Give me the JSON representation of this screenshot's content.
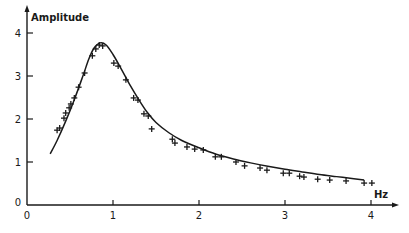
{
  "chart_data": {
    "type": "scatter",
    "title": "",
    "xlabel": "Hz",
    "ylabel": "Amplitude",
    "xlim": [
      0,
      4.3
    ],
    "ylim": [
      0,
      4.3
    ],
    "x_ticks": [
      0,
      1,
      2,
      3,
      4
    ],
    "y_ticks": [
      0,
      1,
      2,
      3,
      4
    ],
    "x_tick_labels": [
      "0",
      "1",
      "2",
      "3",
      "4"
    ],
    "y_tick_labels": [
      "0",
      "1",
      "2",
      "3",
      "4"
    ],
    "grid": false,
    "legend": null,
    "series": [
      {
        "name": "measured",
        "marker": "+",
        "x": [
          0.35,
          0.38,
          0.43,
          0.45,
          0.49,
          0.51,
          0.55,
          0.6,
          0.67,
          0.76,
          0.8,
          0.84,
          0.88,
          1.01,
          1.06,
          1.15,
          1.24,
          1.29,
          1.36,
          1.41,
          1.45,
          1.69,
          1.72,
          1.86,
          1.95,
          2.05,
          2.19,
          2.26,
          2.43,
          2.53,
          2.71,
          2.79,
          2.98,
          3.05,
          3.17,
          3.22,
          3.38,
          3.52,
          3.71,
          3.92,
          4.01
        ],
        "y": [
          1.74,
          1.79,
          2.02,
          2.14,
          2.26,
          2.35,
          2.49,
          2.74,
          3.07,
          3.47,
          3.63,
          3.72,
          3.7,
          3.3,
          3.23,
          2.91,
          2.49,
          2.44,
          2.12,
          2.07,
          1.77,
          1.53,
          1.44,
          1.35,
          1.3,
          1.28,
          1.12,
          1.12,
          1.0,
          0.91,
          0.86,
          0.81,
          0.74,
          0.74,
          0.67,
          0.65,
          0.6,
          0.58,
          0.56,
          0.51,
          0.51
        ]
      },
      {
        "name": "fitted curve",
        "type": "line",
        "x": [
          0.27,
          0.35,
          0.45,
          0.55,
          0.65,
          0.72,
          0.78,
          0.85,
          0.92,
          1.0,
          1.1,
          1.2,
          1.3,
          1.4,
          1.5,
          1.65,
          1.8,
          2.0,
          2.2,
          2.4,
          2.6,
          2.8,
          3.0,
          3.2,
          3.4,
          3.6,
          3.8,
          3.92
        ],
        "y": [
          1.19,
          1.5,
          1.95,
          2.45,
          3.0,
          3.4,
          3.65,
          3.77,
          3.72,
          3.5,
          3.15,
          2.78,
          2.45,
          2.15,
          1.92,
          1.68,
          1.5,
          1.33,
          1.18,
          1.07,
          0.98,
          0.9,
          0.83,
          0.77,
          0.71,
          0.66,
          0.61,
          0.58
        ]
      }
    ]
  }
}
